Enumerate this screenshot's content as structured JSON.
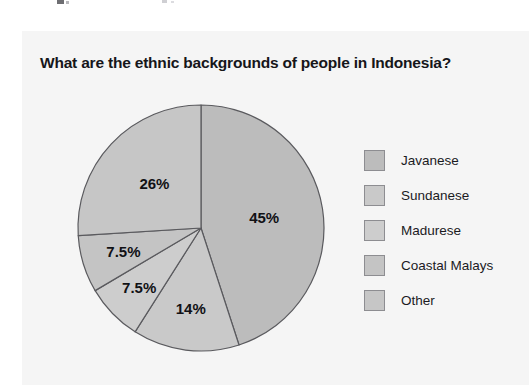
{
  "chart_data": {
    "type": "pie",
    "title": "What are the ethnic backgrounds of people in Indonesia?",
    "categories": [
      "Javanese",
      "Sundanese",
      "Madurese",
      "Coastal Malays",
      "Other"
    ],
    "values": [
      45,
      14,
      7.5,
      7.5,
      26
    ],
    "value_labels": [
      "45%",
      "14%",
      "7.5%",
      "7.5%",
      "26%"
    ],
    "unit": "%",
    "start_angle_deg": 0,
    "direction": "clockwise",
    "legend_position": "right",
    "grid": false,
    "xlabel": "",
    "ylabel": "",
    "slice_colors": [
      "#bcbcbc",
      "#c9c9c9",
      "#cdcdcd",
      "#c4c4c4",
      "#c6c6c6"
    ],
    "slice_outline_color": "#5a5a5e",
    "label_color": "#111115",
    "panel_color": "#f5f5f5",
    "page_color": "#ffffff"
  },
  "legend": {
    "items": [
      {
        "label": "Javanese",
        "swatch_color": "#bcbcbc"
      },
      {
        "label": "Sundanese",
        "swatch_color": "#c9c9c9"
      },
      {
        "label": "Madurese",
        "swatch_color": "#cdcdcd"
      },
      {
        "label": "Coastal Malays",
        "swatch_color": "#c4c4c4"
      },
      {
        "label": "Other",
        "swatch_color": "#c6c6c6"
      }
    ]
  }
}
